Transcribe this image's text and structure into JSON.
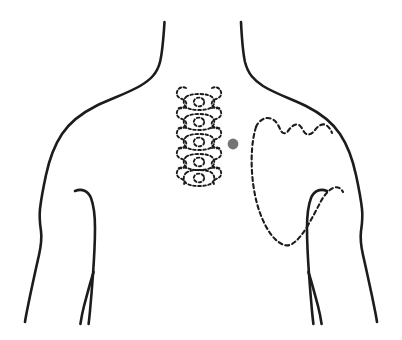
{
  "diagram": {
    "view": "posterior",
    "background_color": "#ffffff",
    "outline_color": "#1c1c1c",
    "bone_color": "#1c1c1c",
    "marker": {
      "label": "pain-point-marker",
      "color": "#757575",
      "cx": 233,
      "cy": 144,
      "r": 5.4,
      "side": "right",
      "region": "medial border of right scapula"
    },
    "parts": [
      {
        "name": "neck-left-contour",
        "style": "solid"
      },
      {
        "name": "neck-right-contour",
        "style": "solid"
      },
      {
        "name": "left-shoulder-and-arm",
        "style": "solid"
      },
      {
        "name": "right-shoulder-and-arm",
        "style": "solid"
      },
      {
        "name": "left-inner-arm-axilla",
        "style": "solid"
      },
      {
        "name": "right-inner-arm-axilla",
        "style": "solid"
      },
      {
        "name": "spine-vertebrae",
        "style": "dashed"
      },
      {
        "name": "right-scapula",
        "style": "dashed"
      }
    ],
    "spine": {
      "name": "thoracic-spine",
      "vertebra_count": 5,
      "style": "dashed",
      "bounds": {
        "x": 175,
        "y": 84,
        "width": 52,
        "height": 98
      }
    },
    "scapula": {
      "name": "right-scapula",
      "style": "dashed",
      "bounds": {
        "x": 252,
        "y": 112,
        "width": 82,
        "height": 136
      }
    }
  }
}
